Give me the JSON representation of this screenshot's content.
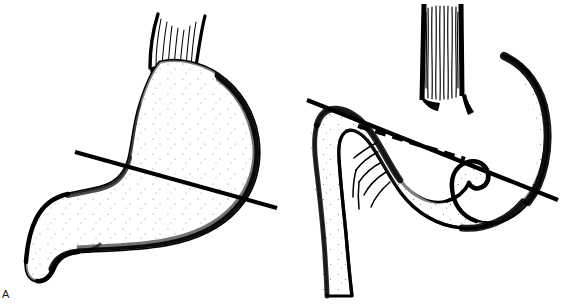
{
  "figure": {
    "width": 580,
    "height": 305,
    "background_color": "#ffffff",
    "ink_color": "#000000",
    "caption_visible": false
  },
  "panels": [
    {
      "id": "A",
      "label": "A",
      "label_position": {
        "x": 2,
        "y": 289
      },
      "subject": "stomach-normal-anatomy",
      "description": "Stomach in normal orientation viewed anteriorly, with esophagus entering at upper left of fundus, body and antrum sweeping down and to the left, pylorus and duodenal bulb at lower left.",
      "structures": [
        {
          "name": "esophagus",
          "rendering": "narrow-striated-stub",
          "stripe_count": 9
        },
        {
          "name": "fundus",
          "rendering": "stippled-dome"
        },
        {
          "name": "body",
          "rendering": "stippled-curved-mass"
        },
        {
          "name": "greater-curvature",
          "rendering": "thick-outline-right-inferior"
        },
        {
          "name": "lesser-curvature",
          "rendering": "thin-outline-left-superior"
        },
        {
          "name": "antrum",
          "rendering": "stippled-taper"
        },
        {
          "name": "pylorus",
          "rendering": "notched-constriction"
        },
        {
          "name": "duodenal-bulb",
          "rendering": "stippled-hook-lower-left"
        }
      ],
      "axis_lines": [
        {
          "name": "organoaxial-axis-line",
          "style": "solid",
          "stroke_width": 4,
          "color": "#000000",
          "start": {
            "x": 75,
            "y": 152
          },
          "end": {
            "x": 277,
            "y": 208
          },
          "meaning": "long axis of the stomach in normal position"
        }
      ]
    },
    {
      "id": "B",
      "label": "B",
      "label_position": {
        "x": 565,
        "y": 288
      },
      "subject": "organoaxial-gastric-volvulus",
      "description": "Stomach rotated about its long axis (organoaxial volvulus). The greater curvature has flipped superiorly, the esophagus is widened and vertical, and the duodenum descends on the left with visible mesenteric vessels.",
      "structures": [
        {
          "name": "esophagus",
          "rendering": "wide-vertical-striated-tube",
          "stripe_count": 13
        },
        {
          "name": "fundus",
          "rendering": "stippled-dome-right"
        },
        {
          "name": "rotated-body",
          "rendering": "stippled-arch-over-top"
        },
        {
          "name": "greater-curvature",
          "rendering": "thick-outline-superior-rotated"
        },
        {
          "name": "antrum",
          "rendering": "stippled-fold-center"
        },
        {
          "name": "pylorus",
          "rendering": "u-turn-fold-lower-center"
        },
        {
          "name": "duodenum-descending",
          "rendering": "stippled-vertical-limb-left"
        },
        {
          "name": "mesenteric-vessels",
          "rendering": "fine-branching-lines",
          "branch_count": 5
        }
      ],
      "axis_lines": [
        {
          "name": "original-axis-line",
          "style": "dashed",
          "stroke_width": 4,
          "dash_pattern": "11 7",
          "color": "#000000",
          "start": {
            "x": 358,
            "y": 126
          },
          "end": {
            "x": 465,
            "y": 159
          },
          "meaning": "original long axis of the stomach before rotation"
        },
        {
          "name": "rotated-axis-line",
          "style": "solid",
          "stroke_width": 4,
          "color": "#000000",
          "start": {
            "x": 307,
            "y": 100
          },
          "end": {
            "x": 558,
            "y": 200
          },
          "meaning": "axis about which the stomach has rotated"
        }
      ]
    }
  ]
}
